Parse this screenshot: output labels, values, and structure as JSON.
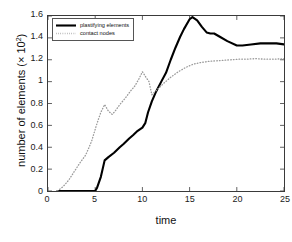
{
  "chart_data": {
    "type": "line",
    "title": "",
    "xlabel": "time",
    "ylabel_prefix": "number of elements (× 10",
    "ylabel_exponent": "2",
    "ylabel_suffix": ")",
    "xlim": [
      0,
      25
    ],
    "ylim": [
      0,
      1.6
    ],
    "xticks": [
      0,
      5,
      10,
      15,
      20,
      25
    ],
    "xticklabels": [
      "0",
      "5",
      "10",
      "15",
      "20",
      "25"
    ],
    "yticks": [
      0,
      0.2,
      0.4,
      0.6,
      0.8,
      1.0,
      1.2,
      1.4,
      1.6
    ],
    "yticklabels": [
      "0",
      "0.2",
      "0.4",
      "0.6",
      "0.8",
      "1",
      "1.2",
      "1.4",
      "1.6"
    ],
    "grid": false,
    "legend_position": "upper left",
    "series": [
      {
        "name": "plastifying elements",
        "style": "solid",
        "color": "#000000",
        "linewidth": 2.1,
        "x": [
          1.0,
          2.0,
          3.0,
          4.0,
          5.0,
          5.2,
          5.6,
          6.0,
          6.4,
          7.0,
          7.6,
          8.0,
          8.6,
          9.0,
          9.5,
          10.0,
          10.3,
          10.6,
          11.0,
          11.4,
          12.0,
          12.5,
          13.0,
          13.5,
          14.0,
          14.4,
          15.0,
          15.3,
          15.8,
          16.3,
          16.8,
          17.2,
          17.6,
          18.2,
          19.0,
          20.0,
          20.6,
          21.5,
          22.5,
          23.4,
          24.2,
          25.0
        ],
        "y": [
          0.0,
          0.0,
          0.0,
          0.0,
          0.0,
          0.03,
          0.13,
          0.28,
          0.31,
          0.35,
          0.4,
          0.43,
          0.48,
          0.51,
          0.55,
          0.58,
          0.62,
          0.72,
          0.82,
          0.9,
          1.0,
          1.08,
          1.2,
          1.31,
          1.41,
          1.48,
          1.57,
          1.59,
          1.56,
          1.5,
          1.45,
          1.44,
          1.44,
          1.41,
          1.37,
          1.33,
          1.33,
          1.34,
          1.35,
          1.35,
          1.35,
          1.34
        ]
      },
      {
        "name": "contact nodes",
        "style": "dotted",
        "color": "#9a9a9a",
        "linewidth": 1.3,
        "x": [
          1.0,
          1.6,
          2.2,
          2.8,
          3.4,
          4.0,
          4.6,
          5.2,
          5.6,
          6.0,
          6.4,
          6.8,
          7.2,
          7.6,
          8.2,
          8.8,
          9.2,
          9.6,
          10.0,
          10.3,
          10.7,
          11.0,
          11.6,
          12.2,
          13.0,
          13.8,
          14.6,
          15.4,
          16.2,
          17.0,
          17.8,
          18.6,
          19.4,
          20.2,
          21.0,
          22.0,
          23.0,
          24.0,
          25.0
        ],
        "y": [
          0.0,
          0.04,
          0.1,
          0.18,
          0.26,
          0.33,
          0.45,
          0.62,
          0.72,
          0.79,
          0.73,
          0.7,
          0.74,
          0.79,
          0.85,
          0.92,
          0.96,
          1.02,
          1.09,
          1.05,
          1.0,
          0.88,
          0.93,
          0.98,
          1.04,
          1.09,
          1.13,
          1.16,
          1.175,
          1.185,
          1.19,
          1.195,
          1.2,
          1.205,
          1.205,
          1.21,
          1.205,
          1.205,
          1.21
        ]
      }
    ],
    "legend": [
      {
        "label": "plastifying elements",
        "style": "solid",
        "color": "#000000"
      },
      {
        "label": "contact nodes",
        "style": "dotted",
        "color": "#9a9a9a"
      }
    ]
  }
}
